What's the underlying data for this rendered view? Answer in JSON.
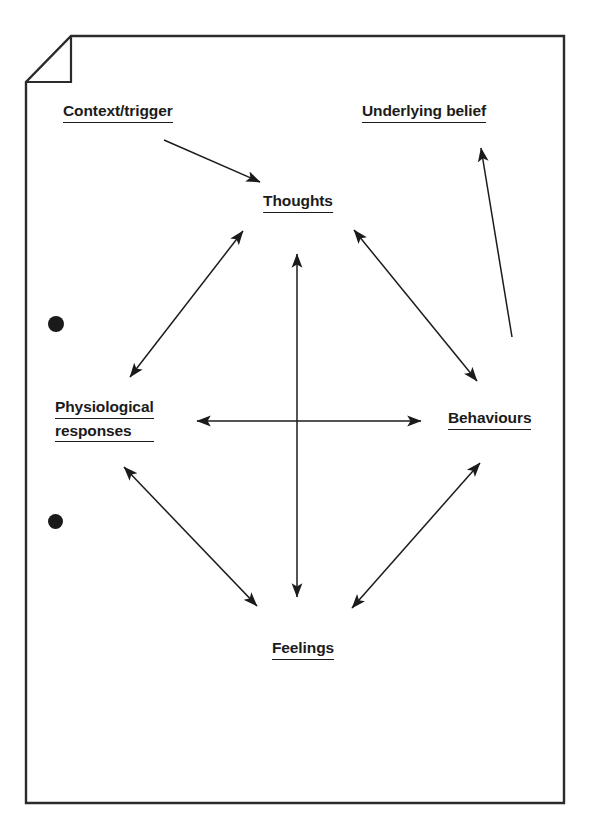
{
  "page": {
    "background_color": "#ffffff",
    "border_color": "#2b2b2b",
    "ink_color": "#1b1b1b",
    "corner_fold": "top-left"
  },
  "punch_holes": [
    {
      "name": "punch-hole-upper",
      "cx": 56,
      "cy": 324,
      "r": 8
    },
    {
      "name": "punch-hole-lower",
      "cx": 56,
      "cy": 522,
      "r": 7.5
    }
  ],
  "diagram": {
    "type": "cycle-diagram",
    "nodes": [
      {
        "id": "context",
        "label": "Context/trigger",
        "lines": [
          "Context/trigger"
        ],
        "x": 63,
        "y": 103,
        "anchor": "left"
      },
      {
        "id": "underlying_belief",
        "label": "Underlying belief",
        "lines": [
          "Underlying belief"
        ],
        "x": 362,
        "y": 103,
        "anchor": "left"
      },
      {
        "id": "thoughts",
        "label": "Thoughts",
        "lines": [
          "Thoughts"
        ],
        "x": 298,
        "y": 193,
        "anchor": "center"
      },
      {
        "id": "physiological",
        "label": "Physiological responses",
        "lines": [
          "Physiological",
          "responses"
        ],
        "x": 55,
        "y": 399,
        "anchor": "left"
      },
      {
        "id": "behaviours",
        "label": "Behaviours",
        "lines": [
          "Behaviours"
        ],
        "x": 448,
        "y": 410,
        "anchor": "left"
      },
      {
        "id": "feelings",
        "label": "Feelings",
        "lines": [
          "Feelings"
        ],
        "x": 303,
        "y": 640,
        "anchor": "center"
      }
    ],
    "edges": [
      {
        "id": "context-to-thoughts",
        "from": "context",
        "to": "thoughts",
        "arrows": "single"
      },
      {
        "id": "thoughts-physiological",
        "from": "thoughts",
        "to": "physiological",
        "arrows": "double"
      },
      {
        "id": "thoughts-behaviours",
        "from": "thoughts",
        "to": "behaviours",
        "arrows": "double"
      },
      {
        "id": "thoughts-feelings",
        "from": "thoughts",
        "to": "feelings",
        "arrows": "double"
      },
      {
        "id": "physiological-behaviours",
        "from": "physiological",
        "to": "behaviours",
        "arrows": "double"
      },
      {
        "id": "physiological-feelings",
        "from": "physiological",
        "to": "feelings",
        "arrows": "double"
      },
      {
        "id": "behaviours-feelings",
        "from": "behaviours",
        "to": "feelings",
        "arrows": "double"
      },
      {
        "id": "behaviours-to-underlying-belief",
        "from": "behaviours",
        "to": "underlying_belief",
        "arrows": "single"
      }
    ]
  }
}
